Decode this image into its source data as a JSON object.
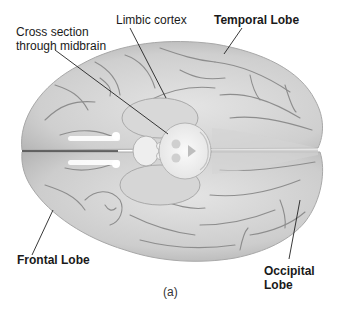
{
  "figure": {
    "view": "inferior view of the brain",
    "caption": "(a)",
    "colors": {
      "background": "#ffffff",
      "brain_fill": "#c9c9c9",
      "brain_highlight": "#e2e2e2",
      "sulci": "#8a8a8a",
      "midbrain_section": "#f4f4f4",
      "leader_line": "#222222",
      "label_text": "#1a1a1a"
    },
    "labels": [
      {
        "id": "cross-section",
        "lines": [
          "Cross section",
          "through midbrain"
        ],
        "bold": false
      },
      {
        "id": "limbic-cortex",
        "lines": [
          "Limbic cortex"
        ],
        "bold": false
      },
      {
        "id": "temporal-lobe",
        "lines": [
          "Temporal Lobe"
        ],
        "bold": true
      },
      {
        "id": "frontal-lobe",
        "lines": [
          "Frontal Lobe"
        ],
        "bold": true
      },
      {
        "id": "occipital-lobe",
        "lines": [
          "Occipital",
          "Lobe"
        ],
        "bold": true
      }
    ]
  }
}
